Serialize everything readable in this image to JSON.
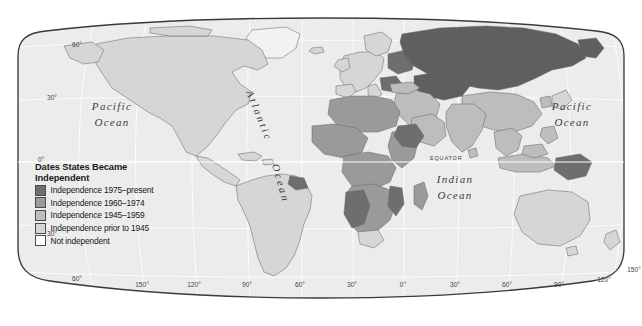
{
  "map": {
    "title": "World map of dates states became independent",
    "projection": "robinson",
    "background_color": "#ffffff",
    "ocean_color": "#ececed",
    "graticule_color": "#ffffff",
    "coast_color": "#6f6f6f",
    "border_color": "#6b6b6b",
    "frame_color": "#3a3a3a"
  },
  "legend": {
    "title_line1": "Dates States Became",
    "title_line2": "Independent",
    "entries": [
      {
        "label": "Independence 1975–present",
        "color": "#6e6e6e",
        "key": "p1975"
      },
      {
        "label": "Independence 1960–1974",
        "color": "#9a9a9a",
        "key": "p1960"
      },
      {
        "label": "Independence 1945–1959",
        "color": "#bdbdbd",
        "key": "p1945"
      },
      {
        "label": "Independence prior to 1945",
        "color": "#d6d6d6",
        "key": "prior"
      },
      {
        "label": "Not independent",
        "color": "#ffffff",
        "key": "none"
      }
    ]
  },
  "ocean_labels": [
    {
      "name": "pacific-west",
      "line1": "Pacific",
      "line2": "Ocean",
      "x": 112,
      "y": 110
    },
    {
      "name": "pacific-east",
      "line1": "Pacific",
      "line2": "Ocean",
      "x": 572,
      "y": 110
    },
    {
      "name": "indian",
      "line1": "Indian",
      "line2": "Ocean",
      "x": 455,
      "y": 180
    },
    {
      "name": "atlantic",
      "line1": "Atlantic",
      "line2": "Ocean",
      "x": 262,
      "y": 140
    }
  ],
  "equator_label": "EQUATOR",
  "latitude_labels": [
    {
      "text": "60°",
      "x": 72,
      "y": 47
    },
    {
      "text": "30°",
      "x": 47,
      "y": 100
    },
    {
      "text": "0°",
      "x": 38,
      "y": 162
    },
    {
      "text": "30°",
      "x": 47,
      "y": 236
    },
    {
      "text": "60°",
      "x": 72,
      "y": 281
    }
  ],
  "longitude_labels": [
    {
      "text": "150°",
      "x": 142
    },
    {
      "text": "120°",
      "x": 194
    },
    {
      "text": "90°",
      "x": 247
    },
    {
      "text": "60°",
      "x": 300
    },
    {
      "text": "30°",
      "x": 352
    },
    {
      "text": "0°",
      "x": 403
    },
    {
      "text": "30°",
      "x": 455
    },
    {
      "text": "60°",
      "x": 507
    },
    {
      "text": "90°",
      "x": 559
    },
    {
      "text": "120°",
      "x": 604
    },
    {
      "text": "150°",
      "x": 636
    }
  ],
  "longitude_label_y": 287
}
